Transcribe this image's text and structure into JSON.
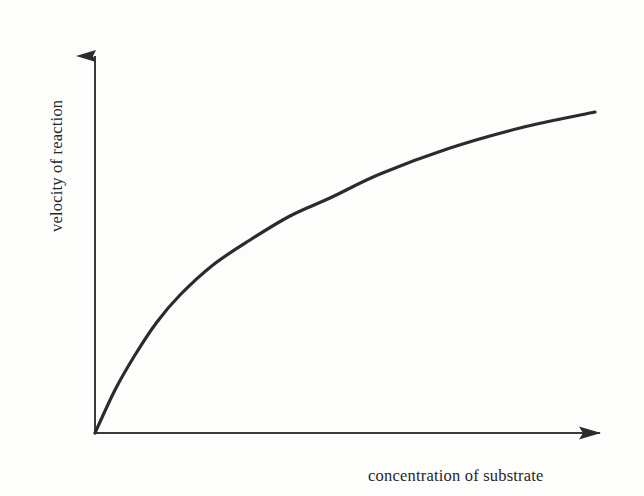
{
  "figure": {
    "background_color": "#fdfdfc",
    "ink_color": "#2b2b2b"
  },
  "chart_data": {
    "type": "line",
    "title": "",
    "subtitle": "",
    "xlabel": "concentration of substrate",
    "ylabel": "velocity of reaction",
    "grid": false,
    "legend": false,
    "legend_position": "none",
    "xlim": [
      0,
      1
    ],
    "ylim": [
      0,
      1
    ],
    "xticks": [],
    "yticks": [],
    "xtick_labels": [],
    "ytick_labels": [],
    "annotations": [],
    "axis_style": {
      "x_axis_arrow": true,
      "y_axis_arrow": true,
      "spines": [
        "left",
        "bottom"
      ]
    },
    "series": [
      {
        "name": "velocity of reaction",
        "color": "#2b2b2b",
        "line_width": 3,
        "x": [
          0.0,
          0.04,
          0.08,
          0.12,
          0.16,
          0.22,
          0.3,
          0.4,
          0.5,
          0.62,
          0.75,
          0.88,
          1.0
        ],
        "y": [
          0.0,
          0.21,
          0.33,
          0.43,
          0.5,
          0.58,
          0.66,
          0.73,
          0.79,
          0.85,
          0.9,
          0.94,
          0.97
        ]
      }
    ],
    "pixel_geometry": {
      "origin": [
        95,
        433
      ],
      "x_axis_end": [
        618,
        433
      ],
      "y_axis_top": [
        95,
        38
      ],
      "curve_end": [
        595,
        112
      ],
      "curve_points": [
        [
          95,
          433
        ],
        [
          115,
          390
        ],
        [
          135,
          355
        ],
        [
          157,
          322
        ],
        [
          180,
          295
        ],
        [
          213,
          265
        ],
        [
          250,
          240
        ],
        [
          290,
          216
        ],
        [
          330,
          198
        ],
        [
          380,
          174
        ],
        [
          450,
          148
        ],
        [
          520,
          128
        ],
        [
          595,
          112
        ]
      ]
    }
  },
  "labels": {
    "y_axis": "velocity of reaction",
    "x_axis": "concentration of substrate"
  }
}
